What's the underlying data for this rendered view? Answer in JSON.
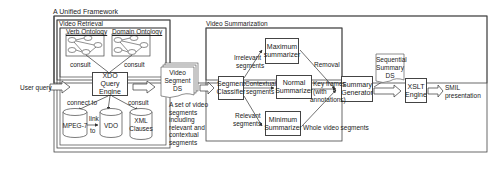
{
  "framework": {
    "title": "A Unified Framework"
  },
  "retrieval": {
    "title": "Video Retrieval",
    "verb_ontology": "Verb Ontology",
    "domain_ontology": "Domain Ontology",
    "consult_left": "consult",
    "consult_right": "consult",
    "engine_line1": "XDO",
    "engine_line2": "Query",
    "engine_line3": "Engine",
    "connect_to": "connect to",
    "consult_xml": "consult",
    "link_to_1": "link",
    "link_to_2": "to",
    "db_mpeg": "MPEG-7",
    "db_vdo": "VDO",
    "db_xml_1": "XML",
    "db_xml_2": "Clauses"
  },
  "inputs": {
    "user_query": "User query"
  },
  "segment_ds": {
    "line1": "Video",
    "line2": "Segment",
    "line3": "DS",
    "caption": [
      "A set of video",
      "segments",
      "including",
      "relevant and",
      "contextual",
      "segments"
    ]
  },
  "summarization": {
    "title": "Video Summarization",
    "classifier_1": "Segment",
    "classifier_2": "Classifier",
    "max_1": "Maximum",
    "max_2": "summarizer",
    "normal_1": "Normal",
    "normal_2": "Summarizer",
    "min_1": "Minimum",
    "min_2": "Summarizer",
    "generator_1": "Summary",
    "generator_2": "Generator",
    "irrelevant_1": "Irrelevant",
    "irrelevant_2": "segments",
    "contextual_1": "Contextual",
    "contextual_2": "segments",
    "relevant_1": "Relevant",
    "relevant_2": "segments",
    "removal": "Removal",
    "keyframes_1": "Key frames",
    "keyframes_2": "(with",
    "keyframes_3": "annotations)",
    "whole": "Whole video segments"
  },
  "sequential_ds": {
    "line1": "Sequential",
    "line2": "Summary",
    "line3": "DS"
  },
  "xslt": {
    "line1": "XSLT",
    "line2": "Engine"
  },
  "output": {
    "line1": "SMIL",
    "line2": "presentation"
  }
}
